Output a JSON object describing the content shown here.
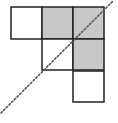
{
  "diagram": {
    "cell_size": 31,
    "colors": {
      "background": "#ffffff",
      "stroke": "#222222",
      "shaded": "#c8c8c8",
      "line": "#555555"
    },
    "cells": [
      {
        "id": "r0c0",
        "row": 0,
        "col": 0,
        "x": 11,
        "y": 7,
        "shaded": false
      },
      {
        "id": "r0c1",
        "row": 0,
        "col": 1,
        "x": 42,
        "y": 7,
        "shaded": true
      },
      {
        "id": "r0c2",
        "row": 0,
        "col": 2,
        "x": 73,
        "y": 7,
        "shaded": true
      },
      {
        "id": "r1c1",
        "row": 1,
        "col": 1,
        "x": 42,
        "y": 39,
        "shaded": false
      },
      {
        "id": "r1c2",
        "row": 1,
        "col": 2,
        "x": 73,
        "y": 39,
        "shaded": true
      },
      {
        "id": "r2c2",
        "row": 2,
        "col": 2,
        "x": 73,
        "y": 71,
        "shaded": false
      }
    ],
    "symmetry_line": {
      "style": "dotted",
      "x1": 1,
      "y1": 113,
      "x2": 113,
      "y2": 1
    }
  }
}
